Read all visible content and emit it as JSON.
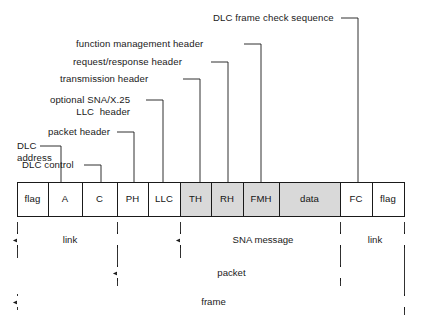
{
  "figure": {
    "colors": {
      "line": "#1a1a1a",
      "shaded_fill": "#d9d9d9",
      "plain_fill": "#ffffff",
      "background": "#ffffff",
      "text": "#1a1a1a"
    }
  },
  "frame_fields": [
    {
      "id": "flag-left",
      "label": "flag",
      "shaded": false,
      "x": 17,
      "w": 31
    },
    {
      "id": "a",
      "label": "A",
      "shaded": false,
      "x": 48,
      "w": 34
    },
    {
      "id": "c",
      "label": "C",
      "shaded": false,
      "x": 82,
      "w": 35
    },
    {
      "id": "ph",
      "label": "PH",
      "shaded": false,
      "x": 117,
      "w": 31
    },
    {
      "id": "llc",
      "label": "LLC",
      "shaded": false,
      "x": 148,
      "w": 32
    },
    {
      "id": "th",
      "label": "TH",
      "shaded": true,
      "x": 180,
      "w": 31
    },
    {
      "id": "rh",
      "label": "RH",
      "shaded": true,
      "x": 211,
      "w": 32
    },
    {
      "id": "fmh",
      "label": "FMH",
      "shaded": true,
      "x": 243,
      "w": 36
    },
    {
      "id": "data",
      "label": "data",
      "shaded": true,
      "x": 279,
      "w": 61
    },
    {
      "id": "fc",
      "label": "FC",
      "shaded": false,
      "x": 340,
      "w": 32
    },
    {
      "id": "flag-right",
      "label": "flag",
      "shaded": false,
      "x": 372,
      "w": 32
    }
  ],
  "callouts": [
    {
      "id": "dlc-address",
      "lines": [
        "DLC",
        "address"
      ],
      "text_x": 17,
      "text_y": 140,
      "text_align": "left",
      "elbow_x": 61,
      "elbow_y": 146,
      "target_x": 61,
      "target_y": 182,
      "text_end_x": 40
    },
    {
      "id": "dlc-control",
      "lines": [
        "DLC control"
      ],
      "text_x": 22,
      "text_y": 159,
      "text_align": "left",
      "elbow_x": 101,
      "elbow_y": 165,
      "target_x": 101,
      "target_y": 182,
      "text_end_x": 84
    },
    {
      "id": "packet-header",
      "lines": [
        "packet header"
      ],
      "text_x": 48,
      "text_y": 126,
      "text_align": "left",
      "elbow_x": 134,
      "elbow_y": 132,
      "target_x": 134,
      "target_y": 182,
      "text_end_x": 117
    },
    {
      "id": "optional-sna-x25-llc-header",
      "lines": [
        "optional SNA/X.25",
        "LLC  header"
      ],
      "text_x": 50,
      "text_y": 94,
      "text_align": "left",
      "elbow_x": 163,
      "elbow_y": 100,
      "target_x": 163,
      "target_y": 182,
      "text_end_x": 146
    },
    {
      "id": "transmission-header",
      "lines": [
        "transmission header"
      ],
      "text_x": 60,
      "text_y": 73,
      "text_align": "left",
      "elbow_x": 200,
      "elbow_y": 79,
      "target_x": 200,
      "target_y": 182,
      "text_end_x": 183
    },
    {
      "id": "request-response-header",
      "lines": [
        "request/response header"
      ],
      "text_x": 73,
      "text_y": 56,
      "text_align": "left",
      "elbow_x": 228,
      "elbow_y": 62,
      "target_x": 228,
      "target_y": 182,
      "text_end_x": 211
    },
    {
      "id": "function-management-header",
      "lines": [
        "function management header"
      ],
      "text_x": 76,
      "text_y": 38,
      "text_align": "left",
      "elbow_x": 261,
      "elbow_y": 44,
      "target_x": 261,
      "target_y": 182,
      "text_end_x": 244
    },
    {
      "id": "dlc-frame-check-sequence",
      "lines": [
        "DLC frame check sequence"
      ],
      "text_x": 213,
      "text_y": 12,
      "text_align": "left",
      "elbow_x": 358,
      "elbow_y": 18,
      "target_x": 358,
      "target_y": 182,
      "text_end_x": 341
    }
  ],
  "brackets": [
    {
      "id": "link-left",
      "label": "link",
      "x1": 17,
      "x2": 117,
      "y": 240
    },
    {
      "id": "sna-message",
      "label": "SNA message",
      "x1": 180,
      "x2": 340,
      "y": 240
    },
    {
      "id": "link-right",
      "label": "link",
      "x1": 340,
      "x2": 404,
      "y": 240
    },
    {
      "id": "packet",
      "label": "packet",
      "x1": 117,
      "x2": 340,
      "y": 273
    },
    {
      "id": "frame",
      "label": "frame",
      "x1": 17,
      "x2": 404,
      "y": 302
    }
  ],
  "bracket_guides": [
    {
      "id": "guide-flag-left",
      "x": 17,
      "y1": 222,
      "y2": 258
    },
    {
      "id": "guide-ph-start",
      "x": 117,
      "y1": 222,
      "y2": 286
    },
    {
      "id": "guide-th-start",
      "x": 180,
      "y1": 222,
      "y2": 258
    },
    {
      "id": "guide-fc-start",
      "x": 340,
      "y1": 222,
      "y2": 286
    },
    {
      "id": "guide-frame-end",
      "x": 404,
      "y1": 222,
      "y2": 315
    }
  ],
  "geometry": {
    "box_top": 182,
    "box_bottom": 216,
    "box_left": 17,
    "box_right": 404
  }
}
